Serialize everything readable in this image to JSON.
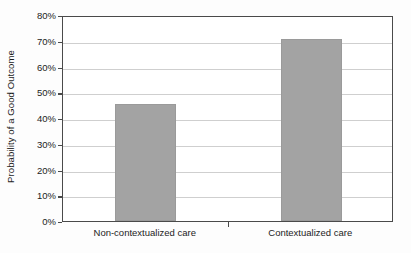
{
  "chart_data": {
    "type": "bar",
    "title": "",
    "subtitle": "",
    "xlabel": "",
    "ylabel": "Probability of a Good Outcome",
    "categories": [
      "Non-contextualized care",
      "Contextualized care"
    ],
    "values": [
      45.5,
      70.5
    ],
    "value_labels": [
      "45.5%",
      "70.5%"
    ],
    "ylim": [
      0,
      80
    ],
    "ytick_values": [
      0,
      10,
      20,
      30,
      40,
      50,
      60,
      70,
      80
    ],
    "ytick_labels": [
      "0%",
      "10%",
      "20%",
      "30%",
      "40%",
      "50%",
      "60%",
      "70%",
      "80%"
    ],
    "grid": "horizontal",
    "legend": "none",
    "orientation": "vertical",
    "series": [
      {
        "name": "Probability of a Good Outcome",
        "values": [
          45.5,
          70.5
        ]
      }
    ],
    "colors": {
      "bar_fill": "#a3a3a3",
      "bar_border": "#9a9a9a",
      "axis_line": "#4a4a4a",
      "gridline": "#cfcfcf",
      "text": "#1c1c1c",
      "background": "#ffffff"
    }
  }
}
